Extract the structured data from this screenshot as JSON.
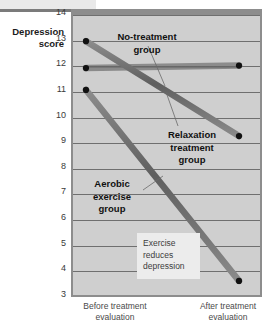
{
  "chart_data": {
    "type": "line",
    "title": "",
    "xlabel": "",
    "ylabel": "Depression score",
    "ylim": [
      3,
      14
    ],
    "yticks": [
      14,
      13,
      12,
      11,
      10,
      9,
      8,
      7,
      6,
      5,
      4,
      3
    ],
    "grid": true,
    "legend_position": "inline-annotations",
    "categories": [
      "Before treatment evaluation",
      "After treatment evaluation"
    ],
    "series": [
      {
        "name": "No-treatment group",
        "values": [
          11.85,
          11.95
        ]
      },
      {
        "name": "Relaxation treatment group",
        "values": [
          12.9,
          9.2
        ]
      },
      {
        "name": "Aerobic exercise group",
        "values": [
          11.0,
          3.55
        ]
      }
    ],
    "annotations": [
      {
        "name": "no-treatment-label",
        "text_lines": [
          "No-treatment",
          "group"
        ]
      },
      {
        "name": "relaxation-label",
        "text_lines": [
          "Relaxation",
          "treatment",
          "group"
        ]
      },
      {
        "name": "aerobic-label",
        "text_lines": [
          "Aerobic",
          "exercise",
          "group"
        ]
      },
      {
        "name": "conclusion-callout",
        "text_lines": [
          "Exercise",
          "reduces",
          "depression"
        ]
      }
    ],
    "colors": {
      "plot_background": "#cfcfcf",
      "frame": "#8d8d8d",
      "gridline": "#6f6f6f",
      "series_line": "#6b6b6b",
      "marker": "#111111",
      "callout_background": "#ececec",
      "page_background": "#ffffff"
    }
  },
  "axis": {
    "y_title_line1": "Depression",
    "y_title_line2": "score",
    "y_labels": [
      "14",
      "13",
      "12",
      "11",
      "10",
      "9",
      "8",
      "7",
      "6",
      "5",
      "4",
      "3"
    ],
    "x_left_line1": "Before treatment",
    "x_left_line2": "evaluation",
    "x_right_line1": "After treatment",
    "x_right_line2": "evaluation"
  },
  "labels": {
    "no_treatment_l1": "No-treatment",
    "no_treatment_l2": "group",
    "relaxation_l1": "Relaxation",
    "relaxation_l2": "treatment",
    "relaxation_l3": "group",
    "aerobic_l1": "Aerobic",
    "aerobic_l2": "exercise",
    "aerobic_l3": "group",
    "callout_l1": "Exercise",
    "callout_l2": "reduces",
    "callout_l3": "depression"
  }
}
